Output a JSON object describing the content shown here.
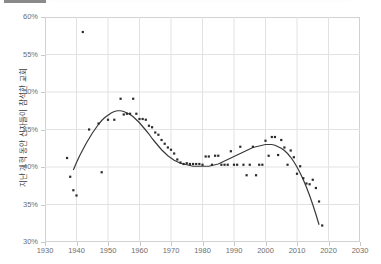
{
  "top_fragment": {
    "label": ""
  },
  "chart_data": {
    "type": "scatter",
    "title": "",
    "xlabel": "",
    "ylabel": "지난 개혁 동안 신자들이 참석한 교회",
    "xlim": [
      1930,
      2030
    ],
    "ylim": [
      30,
      60
    ],
    "xticks": [
      1930,
      1940,
      1950,
      1960,
      1970,
      1980,
      1990,
      2000,
      2010,
      2020,
      2030
    ],
    "xtick_labels": [
      "1930",
      "1940",
      "1950",
      "1960",
      "1970",
      "1980",
      "1990",
      "2000",
      "2010",
      "2020",
      "2030"
    ],
    "yticks": [
      30,
      35,
      40,
      45,
      50,
      55,
      60
    ],
    "ytick_labels": [
      "30%",
      "35%",
      "40%",
      "45%",
      "50%",
      "55%",
      "60%"
    ],
    "grid": true,
    "legend": "none",
    "marker_color": "#2b2b2b",
    "trend_color": "#3a3a3a",
    "grid_color": "#e2e2e2",
    "axis_color": "#d2d2d2",
    "tick_text_color": "#6e6e6e",
    "points": [
      {
        "x": 1937,
        "y": 41.2
      },
      {
        "x": 1938,
        "y": 38.7
      },
      {
        "x": 1939,
        "y": 36.9
      },
      {
        "x": 1940,
        "y": 36.2
      },
      {
        "x": 1942,
        "y": 58.0
      },
      {
        "x": 1944,
        "y": 45.0
      },
      {
        "x": 1947,
        "y": 45.8
      },
      {
        "x": 1948,
        "y": 39.3
      },
      {
        "x": 1950,
        "y": 46.3
      },
      {
        "x": 1952,
        "y": 46.3
      },
      {
        "x": 1954,
        "y": 49.1
      },
      {
        "x": 1955,
        "y": 47.0
      },
      {
        "x": 1956,
        "y": 47.1
      },
      {
        "x": 1957,
        "y": 47.1
      },
      {
        "x": 1958,
        "y": 49.1
      },
      {
        "x": 1959,
        "y": 47.1
      },
      {
        "x": 1960,
        "y": 46.4
      },
      {
        "x": 1961,
        "y": 46.4
      },
      {
        "x": 1962,
        "y": 46.3
      },
      {
        "x": 1963,
        "y": 45.5
      },
      {
        "x": 1964,
        "y": 45.3
      },
      {
        "x": 1965,
        "y": 44.6
      },
      {
        "x": 1966,
        "y": 44.3
      },
      {
        "x": 1967,
        "y": 43.6
      },
      {
        "x": 1968,
        "y": 43.1
      },
      {
        "x": 1969,
        "y": 42.6
      },
      {
        "x": 1970,
        "y": 42.3
      },
      {
        "x": 1971,
        "y": 41.8
      },
      {
        "x": 1972,
        "y": 41.0
      },
      {
        "x": 1973,
        "y": 40.6
      },
      {
        "x": 1974,
        "y": 40.4
      },
      {
        "x": 1975,
        "y": 40.5
      },
      {
        "x": 1976,
        "y": 40.4
      },
      {
        "x": 1977,
        "y": 40.4
      },
      {
        "x": 1978,
        "y": 40.4
      },
      {
        "x": 1979,
        "y": 40.4
      },
      {
        "x": 1980,
        "y": 40.3
      },
      {
        "x": 1981,
        "y": 41.4
      },
      {
        "x": 1982,
        "y": 41.4
      },
      {
        "x": 1983,
        "y": 40.3
      },
      {
        "x": 1984,
        "y": 41.5
      },
      {
        "x": 1985,
        "y": 41.5
      },
      {
        "x": 1986,
        "y": 40.3
      },
      {
        "x": 1987,
        "y": 40.3
      },
      {
        "x": 1988,
        "y": 40.3
      },
      {
        "x": 1989,
        "y": 42.1
      },
      {
        "x": 1990,
        "y": 40.3
      },
      {
        "x": 1991,
        "y": 40.3
      },
      {
        "x": 1992,
        "y": 42.7
      },
      {
        "x": 1993,
        "y": 40.3
      },
      {
        "x": 1994,
        "y": 38.9
      },
      {
        "x": 1995,
        "y": 40.3
      },
      {
        "x": 1996,
        "y": 42.7
      },
      {
        "x": 1997,
        "y": 38.9
      },
      {
        "x": 1998,
        "y": 40.3
      },
      {
        "x": 1999,
        "y": 40.3
      },
      {
        "x": 2000,
        "y": 43.5
      },
      {
        "x": 2001,
        "y": 41.5
      },
      {
        "x": 2002,
        "y": 44.0
      },
      {
        "x": 2003,
        "y": 44.0
      },
      {
        "x": 2004,
        "y": 41.6
      },
      {
        "x": 2005,
        "y": 43.6
      },
      {
        "x": 2006,
        "y": 42.6
      },
      {
        "x": 2007,
        "y": 40.3
      },
      {
        "x": 2008,
        "y": 42.2
      },
      {
        "x": 2009,
        "y": 41.3
      },
      {
        "x": 2010,
        "y": 39.1
      },
      {
        "x": 2011,
        "y": 40.1
      },
      {
        "x": 2012,
        "y": 38.5
      },
      {
        "x": 2013,
        "y": 37.8
      },
      {
        "x": 2014,
        "y": 37.7
      },
      {
        "x": 2015,
        "y": 38.3
      },
      {
        "x": 2016,
        "y": 37.2
      },
      {
        "x": 2017,
        "y": 35.4
      },
      {
        "x": 2018,
        "y": 32.2
      }
    ],
    "trend": [
      {
        "x": 1939.0,
        "y": 39.6
      },
      {
        "x": 1940.0,
        "y": 40.6
      },
      {
        "x": 1941.0,
        "y": 41.5
      },
      {
        "x": 1942.0,
        "y": 42.3
      },
      {
        "x": 1943.0,
        "y": 43.1
      },
      {
        "x": 1944.0,
        "y": 43.8
      },
      {
        "x": 1945.0,
        "y": 44.5
      },
      {
        "x": 1946.0,
        "y": 45.1
      },
      {
        "x": 1947.0,
        "y": 45.7
      },
      {
        "x": 1948.0,
        "y": 46.2
      },
      {
        "x": 1949.0,
        "y": 46.6
      },
      {
        "x": 1950.0,
        "y": 46.9
      },
      {
        "x": 1951.0,
        "y": 47.2
      },
      {
        "x": 1952.0,
        "y": 47.4
      },
      {
        "x": 1953.0,
        "y": 47.5
      },
      {
        "x": 1954.0,
        "y": 47.5
      },
      {
        "x": 1955.0,
        "y": 47.4
      },
      {
        "x": 1956.0,
        "y": 47.2
      },
      {
        "x": 1957.0,
        "y": 47.0
      },
      {
        "x": 1958.0,
        "y": 46.7
      },
      {
        "x": 1959.0,
        "y": 46.3
      },
      {
        "x": 1960.0,
        "y": 45.9
      },
      {
        "x": 1961.0,
        "y": 45.4
      },
      {
        "x": 1962.0,
        "y": 44.9
      },
      {
        "x": 1963.0,
        "y": 44.4
      },
      {
        "x": 1964.0,
        "y": 43.8
      },
      {
        "x": 1965.0,
        "y": 43.3
      },
      {
        "x": 1966.0,
        "y": 42.8
      },
      {
        "x": 1967.0,
        "y": 42.3
      },
      {
        "x": 1968.0,
        "y": 41.9
      },
      {
        "x": 1969.0,
        "y": 41.5
      },
      {
        "x": 1970.0,
        "y": 41.2
      },
      {
        "x": 1971.0,
        "y": 40.9
      },
      {
        "x": 1972.0,
        "y": 40.7
      },
      {
        "x": 1973.0,
        "y": 40.5
      },
      {
        "x": 1974.0,
        "y": 40.4
      },
      {
        "x": 1975.0,
        "y": 40.3
      },
      {
        "x": 1976.0,
        "y": 40.2
      },
      {
        "x": 1977.0,
        "y": 40.1
      },
      {
        "x": 1978.0,
        "y": 40.1
      },
      {
        "x": 1979.0,
        "y": 40.1
      },
      {
        "x": 1980.0,
        "y": 40.1
      },
      {
        "x": 1981.0,
        "y": 40.1
      },
      {
        "x": 1982.0,
        "y": 40.1
      },
      {
        "x": 1983.0,
        "y": 40.2
      },
      {
        "x": 1984.0,
        "y": 40.3
      },
      {
        "x": 1985.0,
        "y": 40.4
      },
      {
        "x": 1986.0,
        "y": 40.6
      },
      {
        "x": 1987.0,
        "y": 40.8
      },
      {
        "x": 1988.0,
        "y": 41.0
      },
      {
        "x": 1989.0,
        "y": 41.2
      },
      {
        "x": 1990.0,
        "y": 41.4
      },
      {
        "x": 1991.0,
        "y": 41.6
      },
      {
        "x": 1992.0,
        "y": 41.8
      },
      {
        "x": 1993.0,
        "y": 42.0
      },
      {
        "x": 1994.0,
        "y": 42.2
      },
      {
        "x": 1995.0,
        "y": 42.4
      },
      {
        "x": 1996.0,
        "y": 42.6
      },
      {
        "x": 1997.0,
        "y": 42.7
      },
      {
        "x": 1998.0,
        "y": 42.8
      },
      {
        "x": 1999.0,
        "y": 42.9
      },
      {
        "x": 2000.0,
        "y": 43.0
      },
      {
        "x": 2001.0,
        "y": 43.0
      },
      {
        "x": 2002.0,
        "y": 43.0
      },
      {
        "x": 2003.0,
        "y": 42.9
      },
      {
        "x": 2004.0,
        "y": 42.7
      },
      {
        "x": 2005.0,
        "y": 42.5
      },
      {
        "x": 2006.0,
        "y": 42.2
      },
      {
        "x": 2007.0,
        "y": 41.8
      },
      {
        "x": 2008.0,
        "y": 41.3
      },
      {
        "x": 2009.0,
        "y": 40.7
      },
      {
        "x": 2010.0,
        "y": 40.0
      },
      {
        "x": 2011.0,
        "y": 39.2
      },
      {
        "x": 2012.0,
        "y": 38.3
      },
      {
        "x": 2013.0,
        "y": 37.3
      },
      {
        "x": 2014.0,
        "y": 36.2
      },
      {
        "x": 2015.0,
        "y": 35.0
      },
      {
        "x": 2016.0,
        "y": 33.7
      },
      {
        "x": 2017.0,
        "y": 32.3
      }
    ]
  }
}
